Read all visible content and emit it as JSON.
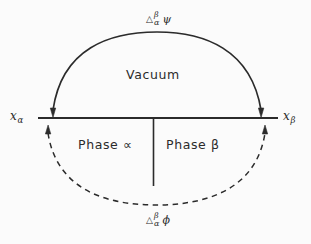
{
  "figure": {
    "background_color": "#fbfbfb",
    "ink_color": "#2b2b2b"
  },
  "labels": {
    "vacuum": "Vacuum",
    "phase_alpha": "Phase ∝",
    "phase_beta": "Phase β",
    "x_alpha_symbol": "x",
    "x_alpha_subscript": "α",
    "x_beta_symbol": "x",
    "x_beta_subscript": "β",
    "top_delta_triangle": "△",
    "top_delta_superscript": "β",
    "top_delta_subscript": "α",
    "top_delta_quantity": "ψ",
    "bottom_delta_triangle": "△",
    "bottom_delta_superscript": "β",
    "bottom_delta_subscript": "α",
    "bottom_delta_quantity": "ϕ"
  },
  "geometry": {
    "interface_line": {
      "x1": 38,
      "y1": 118,
      "x2": 278,
      "y2": 118
    },
    "phase_divider": {
      "x": 153,
      "y1": 118,
      "y2": 186
    },
    "vacuum_arc": {
      "style": "solid",
      "start": {
        "x": 52,
        "y": 116
      },
      "end": {
        "x": 262,
        "y": 116
      },
      "apex_y": 39,
      "arrowheads": "both-ends-pointing-to-line"
    },
    "bulk_arc": {
      "style": "dashed",
      "start": {
        "x": 48,
        "y": 128
      },
      "end": {
        "x": 265,
        "y": 128
      },
      "apex_y": 201,
      "arrowheads": "both-ends-pointing-to-line"
    }
  }
}
